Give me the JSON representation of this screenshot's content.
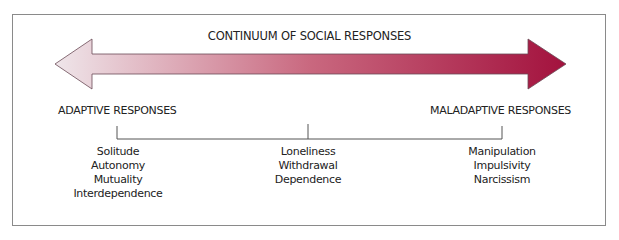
{
  "diagram": {
    "title": "CONTINUUM OF SOCIAL RESPONSES",
    "arrow": {
      "direction": "bidirectional",
      "gradient_start_color": "#efe6ea",
      "gradient_mid_color": "#c9687f",
      "gradient_end_color": "#a3123e",
      "outline_color": "#6a4a55"
    },
    "left_label": "ADAPTIVE RESPONSES",
    "right_label": "MALADAPTIVE RESPONSES",
    "groups": [
      {
        "name": "adaptive",
        "items": [
          "Solitude",
          "Autonomy",
          "Mutuality",
          "Interdependence"
        ]
      },
      {
        "name": "middle",
        "items": [
          "Loneliness",
          "Withdrawal",
          "Dependence"
        ]
      },
      {
        "name": "maladaptive",
        "items": [
          "Manipulation",
          "Impulsivity",
          "Narcissism"
        ]
      }
    ]
  }
}
